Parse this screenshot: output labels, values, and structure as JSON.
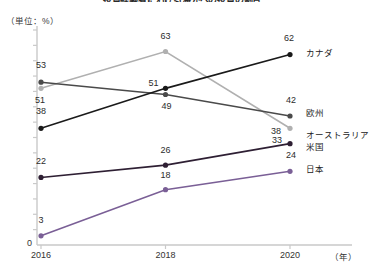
{
  "chart_data": {
    "type": "line",
    "title": "投資経験者における海外への投資の割合",
    "unit_label": "（単位：%）",
    "xlabel": "（年）",
    "ylabel": "",
    "categories": [
      "2016",
      "2018",
      "2020"
    ],
    "x_tick_labels": [
      "2016",
      "2018",
      "2020"
    ],
    "y_tick_labels": [
      "0"
    ],
    "ylim": [
      0,
      70
    ],
    "xlim": [
      2016,
      2020
    ],
    "grid": false,
    "legend_position": "right-of-plot",
    "y_zero_label": "0",
    "series": [
      {
        "name": "カナダ",
        "color": "#1a1a1a",
        "values": [
          38,
          51,
          62
        ],
        "labels": [
          "38",
          "51",
          "62"
        ]
      },
      {
        "name": "欧州",
        "color": "#4a4a4a",
        "values": [
          53,
          49,
          42
        ],
        "labels": [
          "53",
          "49",
          "42"
        ]
      },
      {
        "name": "オーストラリア",
        "color": "#b0b0b0",
        "values": [
          51,
          63,
          38
        ],
        "labels": [
          "51",
          "63",
          "38"
        ]
      },
      {
        "name": "米国",
        "color": "#2e1f33",
        "values": [
          22,
          26,
          33
        ],
        "labels": [
          "22",
          "26",
          "33"
        ]
      },
      {
        "name": "日本",
        "color": "#7a5f96",
        "values": [
          3,
          18,
          24
        ],
        "labels": [
          "3",
          "18",
          "24"
        ]
      }
    ]
  },
  "axis": {
    "color": "#c9c9c9",
    "tick_count": 14,
    "tick_step": 5
  }
}
